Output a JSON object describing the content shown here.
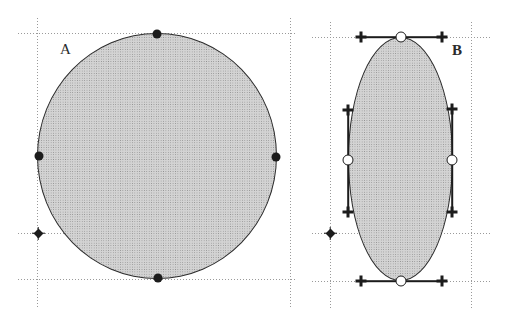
{
  "canvas": {
    "width": 510,
    "height": 312,
    "background": "#ffffff"
  },
  "panels": [
    {
      "id": "A",
      "label": "A",
      "label_x": 60,
      "label_y": 41,
      "shape": {
        "kind": "circle",
        "left": 37,
        "top": 33,
        "width": 240,
        "height": 246,
        "fill": "#d3d3d3",
        "stroke": "#2c2c2c",
        "pattern": "fine-dot-halftone"
      },
      "guides": {
        "vertical": [
          37,
          290
        ],
        "horizontal": [
          33,
          279,
          233
        ],
        "color": "#9a9a9a",
        "style": "dotted"
      },
      "nodes": [
        {
          "name": "node-top",
          "x": 157,
          "y": 34,
          "type": "filled-dot"
        },
        {
          "name": "node-left",
          "x": 39,
          "y": 156,
          "type": "filled-dot"
        },
        {
          "name": "node-right",
          "x": 276,
          "y": 157,
          "type": "filled-dot"
        },
        {
          "name": "node-bottom",
          "x": 158,
          "y": 278,
          "type": "filled-dot"
        }
      ],
      "origin_marker": {
        "x": 38,
        "y": 233,
        "type": "diamond-star"
      }
    },
    {
      "id": "B",
      "label": "B",
      "label_x": 452,
      "label_y": 42,
      "shape": {
        "kind": "ellipse",
        "left": 348,
        "top": 37,
        "width": 105,
        "height": 244,
        "fill": "#d3d3d3",
        "stroke": "#2c2c2c",
        "pattern": "fine-dot-halftone"
      },
      "guides": {
        "vertical": [
          330,
          471
        ],
        "horizontal": [
          37,
          281,
          233
        ],
        "color": "#9a9a9a",
        "style": "dotted"
      },
      "nodes": [
        {
          "name": "node-top",
          "x": 401,
          "y": 37,
          "type": "hollow-circle"
        },
        {
          "name": "node-left",
          "x": 348,
          "y": 160,
          "type": "hollow-circle"
        },
        {
          "name": "node-right",
          "x": 452,
          "y": 160,
          "type": "hollow-circle"
        },
        {
          "name": "node-bottom",
          "x": 401,
          "y": 281,
          "type": "hollow-circle"
        }
      ],
      "tangents": [
        {
          "name": "tangent-top",
          "orient": "h",
          "x1": 361,
          "x2": 442,
          "y": 37
        },
        {
          "name": "tangent-bottom",
          "orient": "h",
          "x1": 361,
          "x2": 442,
          "y": 281
        },
        {
          "name": "tangent-left",
          "orient": "v",
          "y1": 110,
          "y2": 212,
          "x": 348
        },
        {
          "name": "tangent-right",
          "orient": "v",
          "y1": 109,
          "y2": 212,
          "x": 452
        }
      ],
      "handles": [
        {
          "name": "handle-top-left",
          "x": 361,
          "y": 37
        },
        {
          "name": "handle-top-right",
          "x": 442,
          "y": 37
        },
        {
          "name": "handle-bottom-left",
          "x": 361,
          "y": 281
        },
        {
          "name": "handle-bottom-right",
          "x": 442,
          "y": 281
        },
        {
          "name": "handle-left-top",
          "x": 348,
          "y": 110
        },
        {
          "name": "handle-left-bottom",
          "x": 348,
          "y": 212
        },
        {
          "name": "handle-right-top",
          "x": 452,
          "y": 109
        },
        {
          "name": "handle-right-bottom",
          "x": 452,
          "y": 212
        }
      ],
      "origin_marker": {
        "x": 330,
        "y": 233,
        "type": "diamond-star"
      }
    }
  ]
}
